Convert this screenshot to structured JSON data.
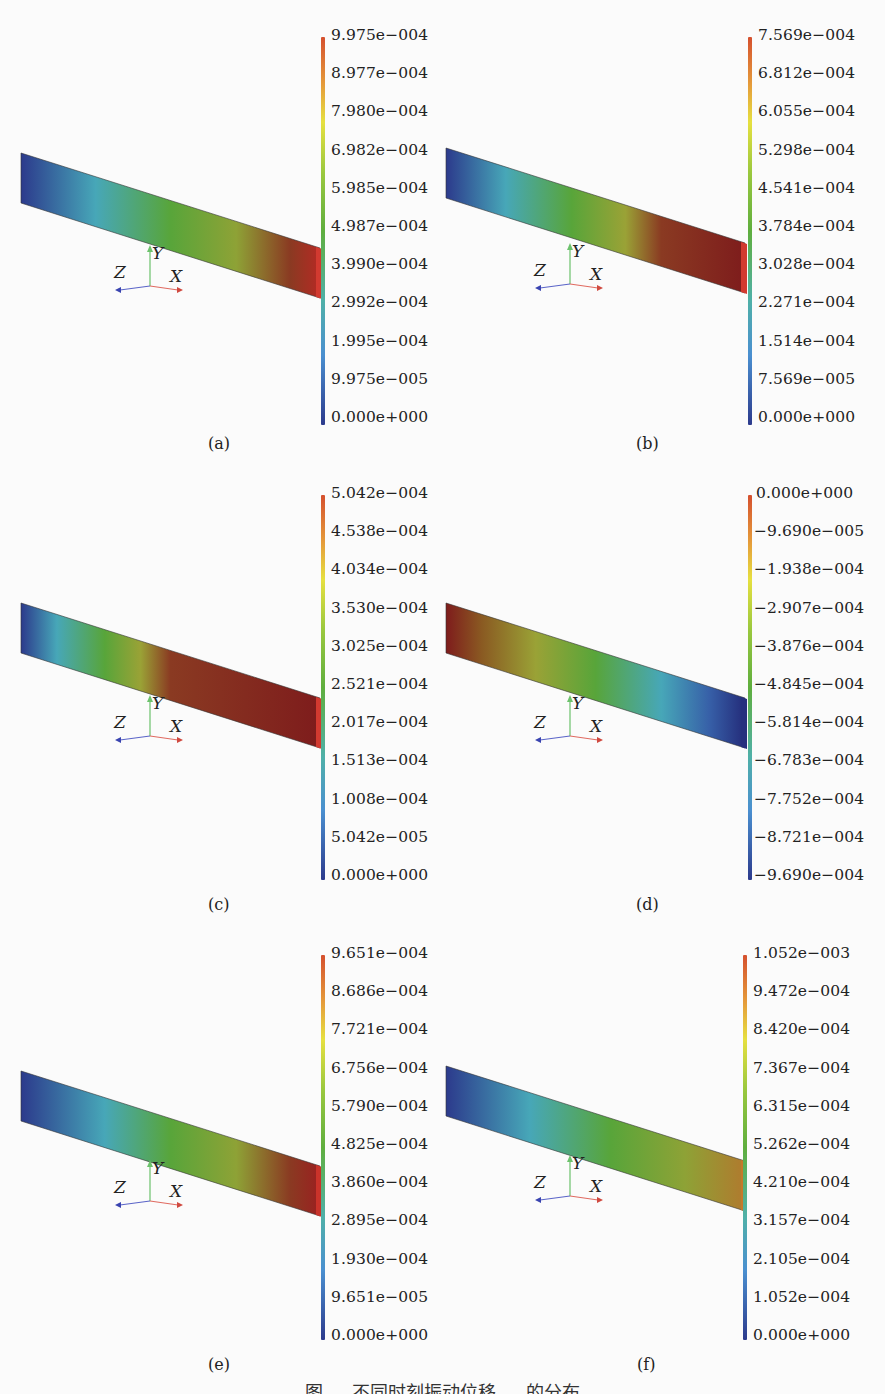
{
  "figure": {
    "caption": "图 … 不同时刻振动位移 … 的分布",
    "panels": [
      {
        "label": "(a)",
        "colorbar_ticks": [
          "9.975e−004",
          "8.977e−004",
          "7.980e−004",
          "6.982e−004",
          "5.985e−004",
          "4.987e−004",
          "3.990e−004",
          "2.992e−004",
          "1.995e−004",
          "9.975e−005",
          "0.000e+000"
        ],
        "gradient_direction": "left-blue-to-right-red"
      },
      {
        "label": "(b)",
        "colorbar_ticks": [
          "7.569e−004",
          "6.812e−004",
          "6.055e−004",
          "5.298e−004",
          "4.541e−004",
          "3.784e−004",
          "3.028e−004",
          "2.271e−004",
          "1.514e−004",
          "7.569e−005",
          "0.000e+000"
        ],
        "gradient_direction": "left-blue-to-right-darkred"
      },
      {
        "label": "(c)",
        "colorbar_ticks": [
          "5.042e−004",
          "4.538e−004",
          "4.034e−004",
          "3.530e−004",
          "3.025e−004",
          "2.521e−004",
          "2.017e−004",
          "1.513e−004",
          "1.008e−004",
          "5.042e−005",
          "0.000e+000"
        ],
        "gradient_direction": "left-blue-to-mid-darkred"
      },
      {
        "label": "(d)",
        "colorbar_ticks": [
          "0.000e+000",
          "−9.690e−005",
          "−1.938e−004",
          "−2.907e−004",
          "−3.876e−004",
          "−4.845e−004",
          "−5.814e−004",
          "−6.783e−004",
          "−7.752e−004",
          "−8.721e−004",
          "−9.690e−004"
        ],
        "gradient_direction": "left-darkred-to-right-blue"
      },
      {
        "label": "(e)",
        "colorbar_ticks": [
          "9.651e−004",
          "8.686e−004",
          "7.721e−004",
          "6.756e−004",
          "5.790e−004",
          "4.825e−004",
          "3.860e−004",
          "2.895e−004",
          "1.930e−004",
          "9.651e−005",
          "0.000e+000"
        ],
        "gradient_direction": "left-blue-to-right-red"
      },
      {
        "label": "(f)",
        "colorbar_ticks": [
          "1.052e−003",
          "9.472e−004",
          "8.420e−004",
          "7.367e−004",
          "6.315e−004",
          "5.262e−004",
          "4.210e−004",
          "3.157e−004",
          "2.105e−004",
          "1.052e−004",
          "0.000e+000"
        ],
        "gradient_direction": "left-blue-to-right-orange"
      }
    ],
    "axes_triad": {
      "x": "X",
      "y": "Y",
      "z": "Z"
    },
    "colors": {
      "blue": "#2c3a8c",
      "cyan": "#47a7b8",
      "green": "#5aa83a",
      "yellow": "#c9c22e",
      "orange": "#c5782a",
      "red": "#c9332a",
      "darkred": "#8a1d1d"
    }
  }
}
